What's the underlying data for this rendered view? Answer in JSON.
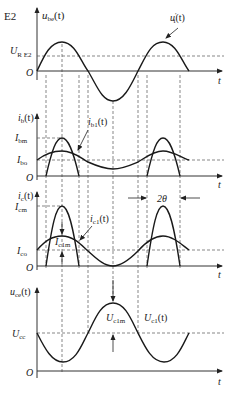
{
  "figure_id": "E2",
  "caption": "",
  "panels": [
    {
      "name": "ube",
      "ylabel": "u",
      "ylabel_sub": "be",
      "ylabel_suffix": "(t)",
      "levels": [
        {
          "label": "U",
          "sub": "R E2",
          "desc": "threshold voltage"
        }
      ],
      "origin": "O",
      "xlabel": "t",
      "curve_label": "u",
      "curve_label_sub": "i",
      "curve_label_sup": "′",
      "curve_label_suffix": "(t)"
    },
    {
      "name": "ib",
      "ylabel": "i",
      "ylabel_sub": "b",
      "ylabel_suffix": "(t)",
      "levels": [
        {
          "label": "I",
          "sub": "bm"
        },
        {
          "label": "I",
          "sub": "bo"
        }
      ],
      "origin": "O",
      "xlabel": "t",
      "curve_label": "i",
      "curve_label_sub": "b1",
      "curve_label_suffix": "(t)"
    },
    {
      "name": "ic",
      "ylabel": "i",
      "ylabel_sub": "c",
      "ylabel_suffix": "(t)",
      "levels": [
        {
          "label": "I",
          "sub": "cm"
        },
        {
          "label": "I",
          "sub": "co"
        }
      ],
      "origin": "O",
      "xlabel": "t",
      "curve_label": "i",
      "curve_label_sub": "c1",
      "curve_label_suffix": "(t)",
      "amplitude_label": "I",
      "amplitude_label_sub": "c1m",
      "angle_label": "2θ"
    },
    {
      "name": "uce",
      "ylabel": "u",
      "ylabel_sub": "ce",
      "ylabel_suffix": "(t)",
      "levels": [
        {
          "label": "U",
          "sub": "cc"
        }
      ],
      "origin": "O",
      "xlabel": "t",
      "amplitude_label": "U",
      "amplitude_label_sub": "c1m",
      "curve_label": "U",
      "curve_label_sub": "c1",
      "curve_label_suffix": "(t)"
    }
  ],
  "colors": {
    "line": "#1a1a1a",
    "dash": "#555555",
    "background": "#ffffff"
  }
}
